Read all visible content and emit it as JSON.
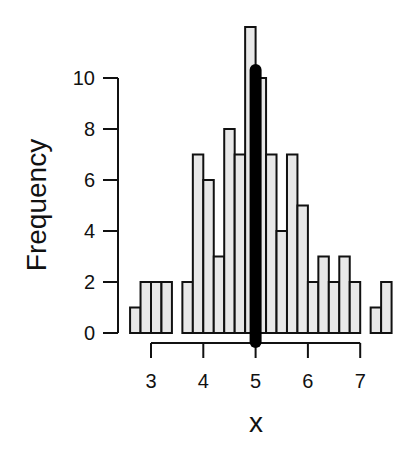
{
  "chart_data": {
    "type": "bar",
    "subtype": "histogram",
    "title": "",
    "xlabel": "x",
    "ylabel": "Frequency",
    "bin_width": 0.2,
    "bin_edges": [
      2.6,
      2.8,
      3.0,
      3.2,
      3.4,
      3.6,
      3.8,
      4.0,
      4.2,
      4.4,
      4.6,
      4.8,
      5.0,
      5.2,
      5.4,
      5.6,
      5.8,
      6.0,
      6.2,
      6.4,
      6.6,
      6.8,
      7.0,
      7.2,
      7.4,
      7.6
    ],
    "values": [
      1,
      2,
      2,
      2,
      0,
      2,
      7,
      6,
      3,
      8,
      7,
      12,
      10,
      7,
      4,
      7,
      5,
      2,
      3,
      2,
      3,
      2,
      0,
      1,
      2
    ],
    "x_ticks": [
      3,
      4,
      5,
      6,
      7
    ],
    "y_ticks": [
      0,
      2,
      4,
      6,
      8,
      10
    ],
    "xlim": [
      2.6,
      7.6
    ],
    "ylim": [
      0,
      12
    ],
    "grid": false,
    "legend": null,
    "annotations": [
      {
        "type": "vertical-line",
        "x": 5,
        "description": "thick black vertical line marking x = 5"
      }
    ],
    "colors": {
      "bar_fill": "#e8e8e8",
      "bar_edge": "#111111",
      "marker_line": "#000000",
      "axis": "#111111"
    }
  }
}
